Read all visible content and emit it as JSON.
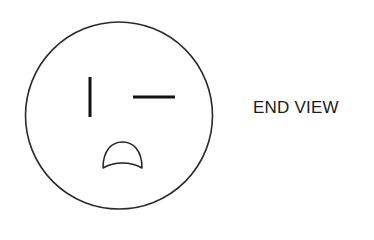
{
  "diagram": {
    "type": "electrical-receptacle-face",
    "label": "END VIEW",
    "colors": {
      "outline": "#2a2a2a",
      "slot": "#111111",
      "background": "#ffffff",
      "text": "#1a1a1a"
    },
    "elements": [
      {
        "name": "outer-circle",
        "shape": "circle"
      },
      {
        "name": "vertical-slot",
        "shape": "line"
      },
      {
        "name": "horizontal-slot",
        "shape": "line"
      },
      {
        "name": "ground-hole",
        "shape": "half-round"
      }
    ]
  }
}
